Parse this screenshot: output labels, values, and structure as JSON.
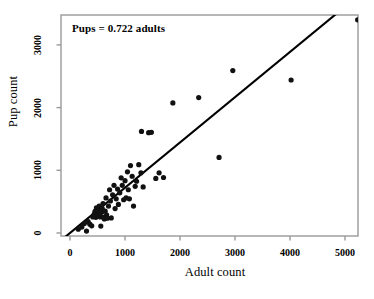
{
  "chart_data": {
    "type": "scatter",
    "title": "",
    "xlabel": "Adult count",
    "ylabel": "Pup count",
    "xlim": [
      0,
      5500
    ],
    "ylim": [
      0,
      3500
    ],
    "xticks": [
      0,
      1000,
      2000,
      3000,
      4000,
      5000
    ],
    "xtick_labels": [
      "0",
      "1000",
      "2000",
      "3000",
      "4000",
      "5000"
    ],
    "yticks": [
      0,
      1000,
      2000,
      3000
    ],
    "ytick_labels": [
      "0",
      "1000",
      "2000",
      "3000"
    ],
    "grid": false,
    "legend": null,
    "annotations": [
      {
        "name": "regression-equation",
        "text": "Pups = 0.722 adults",
        "x": 150,
        "y": 3280
      }
    ],
    "fit_line": {
      "name": "regression-line",
      "slope": 0.722,
      "intercept": 0,
      "x_start": -150,
      "x_end": 4950,
      "color": "#000000",
      "width": 2.1
    },
    "series": [
      {
        "name": "colonies",
        "marker": "filled-circle",
        "color": "#111111",
        "marker_size": 5.2,
        "points": [
          [
            150,
            60
          ],
          [
            215,
            95
          ],
          [
            260,
            150
          ],
          [
            300,
            30
          ],
          [
            330,
            180
          ],
          [
            360,
            140
          ],
          [
            395,
            115
          ],
          [
            415,
            255
          ],
          [
            440,
            300
          ],
          [
            455,
            345
          ],
          [
            470,
            250
          ],
          [
            480,
            400
          ],
          [
            495,
            320
          ],
          [
            505,
            285
          ],
          [
            520,
            365
          ],
          [
            530,
            430
          ],
          [
            540,
            300
          ],
          [
            550,
            255
          ],
          [
            560,
            110
          ],
          [
            575,
            330
          ],
          [
            585,
            395
          ],
          [
            600,
            470
          ],
          [
            610,
            250
          ],
          [
            625,
            225
          ],
          [
            640,
            350
          ],
          [
            655,
            560
          ],
          [
            665,
            290
          ],
          [
            680,
            235
          ],
          [
            700,
            430
          ],
          [
            720,
            690
          ],
          [
            735,
            510
          ],
          [
            750,
            240
          ],
          [
            775,
            610
          ],
          [
            800,
            760
          ],
          [
            820,
            390
          ],
          [
            840,
            545
          ],
          [
            865,
            700
          ],
          [
            880,
            455
          ],
          [
            905,
            640
          ],
          [
            930,
            880
          ],
          [
            950,
            760
          ],
          [
            975,
            530
          ],
          [
            1000,
            835
          ],
          [
            1020,
            560
          ],
          [
            1045,
            975
          ],
          [
            1060,
            690
          ],
          [
            1080,
            545
          ],
          [
            1100,
            1075
          ],
          [
            1130,
            905
          ],
          [
            1155,
            430
          ],
          [
            1185,
            745
          ],
          [
            1210,
            825
          ],
          [
            1250,
            1090
          ],
          [
            1290,
            960
          ],
          [
            1300,
            1620
          ],
          [
            1330,
            735
          ],
          [
            1430,
            1600
          ],
          [
            1480,
            1605
          ],
          [
            1560,
            870
          ],
          [
            1620,
            960
          ],
          [
            1700,
            885
          ],
          [
            1870,
            2075
          ],
          [
            2340,
            2160
          ],
          [
            2710,
            1205
          ],
          [
            2960,
            2590
          ],
          [
            4020,
            2440
          ],
          [
            5230,
            3400
          ]
        ]
      }
    ]
  },
  "axes_geometry": {
    "plot_left_px": 61,
    "plot_right_px": 358,
    "plot_top_px": 15,
    "plot_bottom_px": 236,
    "x0_px": 70,
    "x_per_unit_px": 0.055,
    "y0_px": 233,
    "y_per_unit_px": 0.0627
  },
  "colors": {
    "frame": "#999999",
    "marker": "#111111",
    "line": "#000000",
    "text": "#000000",
    "background": "#ffffff"
  }
}
